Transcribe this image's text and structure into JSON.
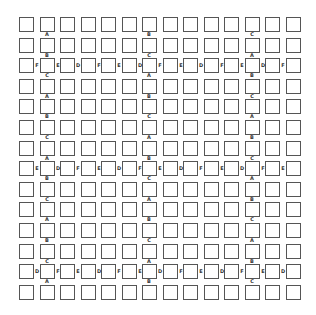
{
  "diagram": {
    "grid": {
      "columns": 14,
      "rows": 14
    },
    "colors": {
      "square_border": "#555555",
      "label": "#333333",
      "background": "#ffffff"
    },
    "labeled_columns": [
      {
        "col": 1,
        "vertical_labels": [
          "A",
          "B",
          "C",
          "A",
          "B",
          "C",
          "A",
          "B",
          "C",
          "A",
          "B",
          "C",
          "A"
        ]
      },
      {
        "col": 6,
        "vertical_labels": [
          "B",
          "C",
          "A",
          "B",
          "C",
          "A",
          "B",
          "C",
          "A",
          "B",
          "C",
          "A",
          "B"
        ]
      },
      {
        "col": 11,
        "vertical_labels": [
          "C",
          "A",
          "B",
          "C",
          "A",
          "B",
          "C",
          "A",
          "B",
          "C",
          "A",
          "B",
          "C"
        ]
      }
    ],
    "labeled_rows": [
      {
        "row": 2,
        "horizontal_labels": [
          "F",
          "E",
          "D",
          "F",
          "E",
          "D",
          "F",
          "E",
          "D",
          "F",
          "E",
          "D",
          "F"
        ]
      },
      {
        "row": 7,
        "horizontal_labels": [
          "E",
          "D",
          "F",
          "E",
          "D",
          "F",
          "E",
          "D",
          "F",
          "E",
          "D",
          "F",
          "E"
        ]
      },
      {
        "row": 12,
        "horizontal_labels": [
          "D",
          "F",
          "E",
          "D",
          "F",
          "E",
          "D",
          "F",
          "E",
          "D",
          "F",
          "E",
          "D"
        ]
      }
    ]
  }
}
